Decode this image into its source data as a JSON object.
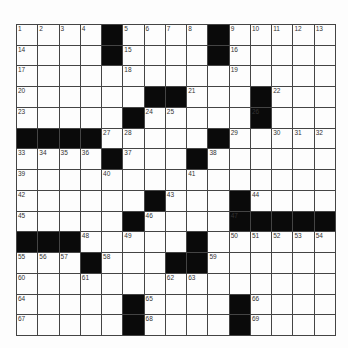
{
  "puzzle": {
    "rows": 15,
    "cols": 15,
    "grid": [
      "....#....#.....",
      "....#....#.....",
      "...............",
      "......##...#...",
      ".....#.....#...",
      "####.....#.....",
      "....#...#......",
      "...............",
      "......#...#....",
      ".....#....#####",
      "###.....#......",
      "...#...##......",
      "...............",
      ".....#....#....",
      ".....#....#...."
    ],
    "numbers": [
      [
        0,
        0,
        1
      ],
      [
        0,
        1,
        2
      ],
      [
        0,
        2,
        3
      ],
      [
        0,
        3,
        4
      ],
      [
        0,
        5,
        5
      ],
      [
        0,
        6,
        6
      ],
      [
        0,
        7,
        7
      ],
      [
        0,
        8,
        8
      ],
      [
        0,
        10,
        9
      ],
      [
        0,
        11,
        10
      ],
      [
        0,
        12,
        11
      ],
      [
        0,
        13,
        12
      ],
      [
        0,
        14,
        13
      ],
      [
        1,
        0,
        14
      ],
      [
        1,
        5,
        15
      ],
      [
        1,
        10,
        16
      ],
      [
        2,
        0,
        17
      ],
      [
        2,
        5,
        18
      ],
      [
        2,
        10,
        19
      ],
      [
        3,
        0,
        20
      ],
      [
        3,
        8,
        21
      ],
      [
        3,
        12,
        22
      ],
      [
        4,
        0,
        23
      ],
      [
        4,
        6,
        24
      ],
      [
        4,
        7,
        25
      ],
      [
        4,
        11,
        26
      ],
      [
        5,
        4,
        27
      ],
      [
        5,
        5,
        28
      ],
      [
        5,
        10,
        29
      ],
      [
        5,
        12,
        30
      ],
      [
        5,
        13,
        31
      ],
      [
        5,
        14,
        32
      ],
      [
        6,
        0,
        33
      ],
      [
        6,
        1,
        34
      ],
      [
        6,
        2,
        35
      ],
      [
        6,
        3,
        36
      ],
      [
        6,
        5,
        37
      ],
      [
        6,
        9,
        38
      ],
      [
        7,
        0,
        39
      ],
      [
        7,
        4,
        40
      ],
      [
        7,
        8,
        41
      ],
      [
        8,
        0,
        42
      ],
      [
        8,
        7,
        43
      ],
      [
        8,
        11,
        44
      ],
      [
        9,
        0,
        45
      ],
      [
        9,
        6,
        46
      ],
      [
        9,
        10,
        47
      ],
      [
        10,
        3,
        48
      ],
      [
        10,
        5,
        49
      ],
      [
        10,
        10,
        50
      ],
      [
        10,
        11,
        51
      ],
      [
        10,
        12,
        52
      ],
      [
        10,
        13,
        53
      ],
      [
        10,
        14,
        54
      ],
      [
        11,
        0,
        55
      ],
      [
        11,
        1,
        56
      ],
      [
        11,
        2,
        57
      ],
      [
        11,
        4,
        58
      ],
      [
        11,
        9,
        59
      ],
      [
        12,
        0,
        60
      ],
      [
        12,
        3,
        61
      ],
      [
        12,
        7,
        62
      ],
      [
        12,
        8,
        63
      ],
      [
        13,
        0,
        64
      ],
      [
        13,
        6,
        65
      ],
      [
        13,
        11,
        66
      ],
      [
        14,
        0,
        67
      ],
      [
        14,
        6,
        68
      ],
      [
        14,
        11,
        69
      ]
    ]
  }
}
